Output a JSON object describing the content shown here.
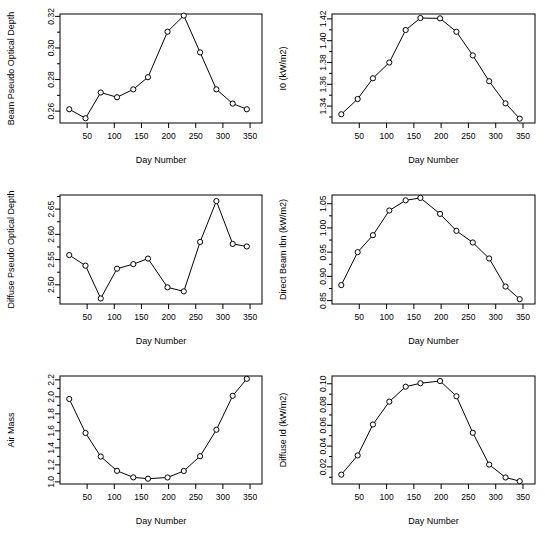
{
  "figure": {
    "background": "#ffffff",
    "line_color": "#000000",
    "marker": "open-circle",
    "rows": 3,
    "cols": 2
  },
  "chart_data": [
    {
      "type": "line",
      "panel": "top-left",
      "title": "",
      "xlabel": "Day Number",
      "ylabel": "Beam Pseudo Optical Depth",
      "xlim": [
        0,
        372
      ],
      "ylim": [
        0.2525,
        0.3215
      ],
      "xticks": [
        50,
        100,
        150,
        200,
        250,
        300,
        350
      ],
      "yticks": [
        0.26,
        0.28,
        0.3,
        0.32
      ],
      "ytick_labels": [
        "0.26",
        "0.28",
        "0.30",
        "0.32"
      ],
      "minor_yticks": [
        0.27,
        0.29,
        0.31
      ],
      "grid": false,
      "legend": "none",
      "x": [
        17,
        47,
        75,
        105,
        135,
        162,
        198,
        228,
        258,
        288,
        318,
        344
      ],
      "values": [
        0.2612,
        0.2555,
        0.2718,
        0.2688,
        0.2738,
        0.2815,
        0.3103,
        0.3205,
        0.2972,
        0.2738,
        0.2648,
        0.2612
      ]
    },
    {
      "type": "line",
      "panel": "top-right",
      "title": "",
      "xlabel": "Day Number",
      "ylabel": "I0 (kW/m2)",
      "xlim": [
        0,
        372
      ],
      "ylim": [
        1.3245,
        1.4245
      ],
      "xticks": [
        50,
        100,
        150,
        200,
        250,
        300,
        350
      ],
      "yticks": [
        1.34,
        1.36,
        1.38,
        1.4,
        1.42
      ],
      "ytick_labels": [
        "1.34",
        "1.36",
        "1.38",
        "1.40",
        "1.42"
      ],
      "minor_yticks": [
        1.33,
        1.35,
        1.37,
        1.39,
        1.41
      ],
      "grid": false,
      "legend": "none",
      "x": [
        17,
        47,
        75,
        105,
        135,
        162,
        198,
        228,
        258,
        288,
        318,
        344
      ],
      "values": [
        1.3325,
        1.3465,
        1.3655,
        1.38,
        1.4098,
        1.4208,
        1.4205,
        1.4082,
        1.3865,
        1.3628,
        1.3425,
        1.3285
      ]
    },
    {
      "type": "line",
      "panel": "middle-left",
      "title": "",
      "xlabel": "Day Number",
      "ylabel": "Diffuse Pseudo Optical Depth",
      "xlim": [
        0,
        372
      ],
      "ylim": [
        2.462,
        2.678
      ],
      "xticks": [
        50,
        100,
        150,
        200,
        250,
        300,
        350
      ],
      "yticks": [
        2.5,
        2.55,
        2.6,
        2.65
      ],
      "ytick_labels": [
        "2.50",
        "2.55",
        "2.60",
        "2.65"
      ],
      "minor_yticks": [
        2.475,
        2.525,
        2.575,
        2.625,
        2.675
      ],
      "grid": false,
      "legend": "none",
      "x": [
        17,
        47,
        75,
        105,
        135,
        162,
        198,
        228,
        258,
        288,
        318,
        344
      ],
      "values": [
        2.559,
        2.538,
        2.473,
        2.532,
        2.541,
        2.552,
        2.495,
        2.487,
        2.585,
        2.666,
        2.581,
        2.576
      ]
    },
    {
      "type": "line",
      "panel": "middle-right",
      "title": "",
      "xlabel": "Day Number",
      "ylabel": "Direct Beam Ibn (kW/m2)",
      "xlim": [
        0,
        372
      ],
      "ylim": [
        0.843,
        1.068
      ],
      "xticks": [
        50,
        100,
        150,
        200,
        250,
        300,
        350
      ],
      "yticks": [
        0.85,
        0.9,
        0.95,
        1.0,
        1.05
      ],
      "ytick_labels": [
        "0.85",
        "0.90",
        "0.95",
        "1.00",
        "1.05"
      ],
      "minor_yticks": [
        0.875,
        0.925,
        0.975,
        1.025
      ],
      "grid": false,
      "legend": "none",
      "x": [
        17,
        47,
        75,
        105,
        135,
        162,
        198,
        228,
        258,
        288,
        318,
        344
      ],
      "values": [
        0.882,
        0.95,
        0.985,
        1.036,
        1.057,
        1.062,
        1.029,
        0.994,
        0.97,
        0.937,
        0.879,
        0.853
      ]
    },
    {
      "type": "line",
      "panel": "bottom-left",
      "title": "",
      "xlabel": "Day Number",
      "ylabel": "Air Mass",
      "xlim": [
        0,
        372
      ],
      "ylim": [
        0.975,
        2.245
      ],
      "xticks": [
        50,
        100,
        150,
        200,
        250,
        300,
        350
      ],
      "yticks": [
        1.0,
        1.2,
        1.4,
        1.6,
        1.8,
        2.0,
        2.2
      ],
      "ytick_labels": [
        "1.0",
        "1.2",
        "1.4",
        "1.6",
        "1.8",
        "2.0",
        "2.2"
      ],
      "minor_yticks": [
        1.1,
        1.3,
        1.5,
        1.7,
        1.9,
        2.1
      ],
      "grid": false,
      "legend": "none",
      "x": [
        17,
        47,
        75,
        105,
        135,
        162,
        198,
        228,
        258,
        288,
        318,
        344
      ],
      "values": [
        1.975,
        1.575,
        1.298,
        1.13,
        1.053,
        1.037,
        1.052,
        1.128,
        1.302,
        1.613,
        2.012,
        2.212
      ]
    },
    {
      "type": "line",
      "panel": "bottom-right",
      "title": "",
      "xlabel": "Day Number",
      "ylabel": "Diffuse Id (kW/m2)",
      "xlim": [
        0,
        372
      ],
      "ylim": [
        0.0035,
        0.1075
      ],
      "xticks": [
        50,
        100,
        150,
        200,
        250,
        300,
        350
      ],
      "yticks": [
        0.02,
        0.04,
        0.06,
        0.08,
        0.1
      ],
      "ytick_labels": [
        "0.02",
        "0.04",
        "0.06",
        "0.08",
        "0.10"
      ],
      "minor_yticks": [
        0.01,
        0.03,
        0.05,
        0.07,
        0.09
      ],
      "grid": false,
      "legend": "none",
      "x": [
        17,
        47,
        75,
        105,
        135,
        162,
        198,
        228,
        258,
        288,
        318,
        344
      ],
      "values": [
        0.0125,
        0.031,
        0.0608,
        0.0828,
        0.0972,
        0.1005,
        0.1027,
        0.088,
        0.0528,
        0.0222,
        0.0098,
        0.0062
      ]
    }
  ]
}
